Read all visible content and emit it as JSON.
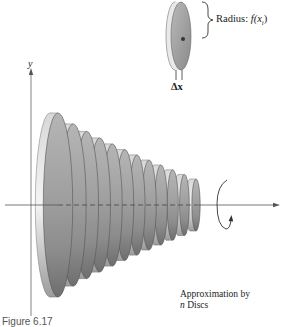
{
  "figure": {
    "single_disc": {
      "radius_label_prefix": "Radius: ",
      "radius_label_func": "f(x",
      "radius_label_sub": "i",
      "radius_label_close": ")",
      "thickness_label": "Δx"
    },
    "axes": {
      "y_label": "y",
      "x_label": ""
    },
    "solid": {
      "disc_count": 12,
      "rotation_icon": "rotation-arrow-icon"
    },
    "caption": {
      "line1": "Approximation by",
      "line2_italic": "n",
      "line2_rest": " Discs"
    },
    "figure_number": "Figure 6.17",
    "colors": {
      "disc_face": "#9a9a9a",
      "disc_face_light": "#cfcfcf",
      "disc_rim": "#e8e8e8",
      "axis": "#555555",
      "text": "#222222"
    }
  }
}
